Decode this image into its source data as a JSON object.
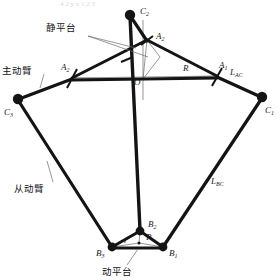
{
  "figure": {
    "kind": "delta-parallel-robot-kinematic-diagram",
    "background": "#ffffff",
    "ink": "#141414",
    "thin_ink": "#555555",
    "width": 280,
    "height": 280
  },
  "annotations": {
    "static_platform": "静平台",
    "driving_arm": "主动臂",
    "driven_arm": "从动臂",
    "moving_platform": "动平台"
  },
  "points": {
    "C2": {
      "label": "C",
      "sub": "2",
      "x": 130,
      "y": 15,
      "lx": 140,
      "ly": 14
    },
    "C3": {
      "label": "C",
      "sub": "3",
      "x": 18,
      "y": 99,
      "lx": 6,
      "ly": 113
    },
    "C1": {
      "label": "C",
      "sub": "1",
      "x": 262,
      "y": 97,
      "lx": 266,
      "ly": 111
    },
    "A2": {
      "label": "A",
      "sub": "2",
      "x": 147,
      "y": 40,
      "lx": 156,
      "ly": 38
    },
    "A3": {
      "label": "A",
      "sub": "3",
      "x": 72,
      "y": 78,
      "lx": 62,
      "ly": 69
    },
    "A1": {
      "label": "A",
      "sub": "1",
      "x": 217,
      "y": 76,
      "lx": 219,
      "ly": 67
    },
    "O": {
      "label": "O",
      "sub": "",
      "x": 143,
      "y": 79,
      "lx": 135,
      "ly": 83
    },
    "B2": {
      "label": "B",
      "sub": "2",
      "x": 140,
      "y": 231,
      "lx": 148,
      "ly": 225
    },
    "B3": {
      "label": "B",
      "sub": "3",
      "x": 112,
      "y": 247,
      "lx": 99,
      "ly": 253
    },
    "B1": {
      "label": "B",
      "sub": "1",
      "x": 163,
      "y": 247,
      "lx": 168,
      "ly": 253
    },
    "P": {
      "label": "P",
      "sub": "",
      "x": 139,
      "y": 243,
      "lx": 145,
      "ly": 238
    }
  },
  "dimensions": {
    "R": {
      "label": "R",
      "sub": "",
      "lx": 185,
      "ly": 70
    },
    "r": {
      "label": "r",
      "sub": "",
      "lx": 126,
      "ly": 241
    },
    "L_upper": {
      "label": "L",
      "sub": "AC",
      "lx": 233,
      "ly": 73
    },
    "L_lower": {
      "label": "L",
      "sub": "BC",
      "lx": 214,
      "ly": 182
    }
  },
  "leaders": {
    "static_platform": {
      "text_x": 46,
      "text_y": 31,
      "from_x": 88,
      "from_y": 36,
      "to_x": 136,
      "to_y": 48,
      "to2_x": 148,
      "to2_y": 57
    },
    "driving_arm": {
      "text_x": 4,
      "text_y": 71,
      "from_x": 44,
      "from_y": 74,
      "to_x": 40,
      "to_y": 88
    },
    "driven_arm": {
      "text_x": 16,
      "text_y": 190,
      "from_x": 53,
      "from_y": 182,
      "to_x": 47,
      "to_y": 161
    },
    "moving_platform": {
      "text_x": 104,
      "text_y": 274,
      "from_x": 127,
      "from_y": 265,
      "to_x": 138,
      "to_y": 249
    }
  },
  "ghost_top_row": "4  2  y      x      1  2  3"
}
